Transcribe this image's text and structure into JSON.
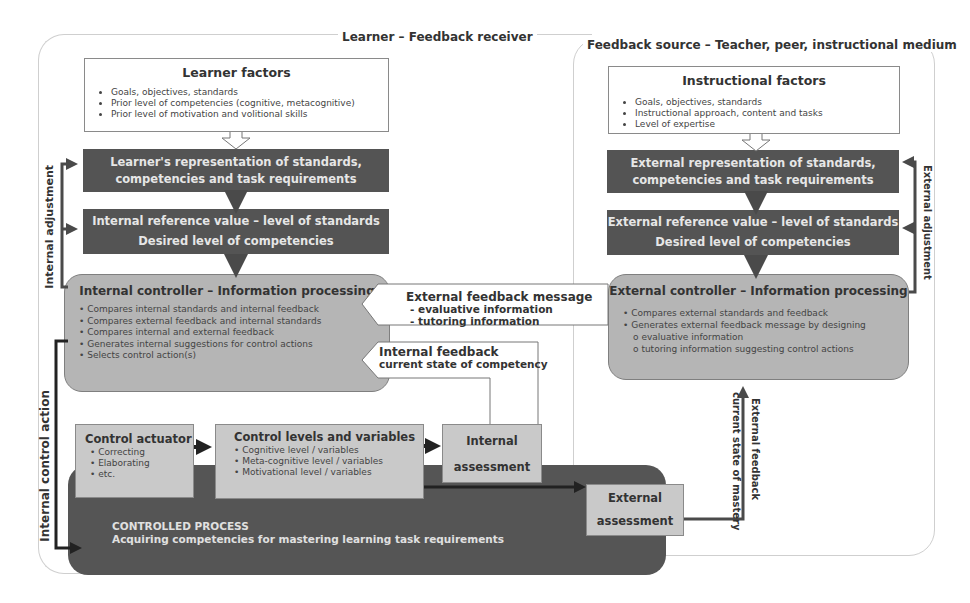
{
  "learner_region": {
    "title": "Learner – Feedback receiver",
    "factors": {
      "title": "Learner factors",
      "items": [
        "Goals, objectives, standards",
        "Prior level of competencies (cognitive, metacognitive)",
        "Prior level of motivation and volitional skills"
      ]
    },
    "representation": {
      "line1": "Learner's representation of  standards,",
      "line2": "competencies and task requirements"
    },
    "reference": {
      "line1": "Internal reference value – level of standards",
      "line2": "Desired level of competencies"
    },
    "controller": {
      "title": "Internal controller – Information processing",
      "items": [
        "Compares internal standards and internal feedback",
        "Compares external feedback and internal standards",
        "Compares internal and external feedback",
        "Generates internal suggestions for control actions",
        "Selects control action(s)"
      ]
    },
    "adjustment_label": "Internal adjustment",
    "control_action_label": "Internal control action",
    "actuator": {
      "title": "Control actuator",
      "items": [
        "Correcting",
        "Elaborating",
        "etc."
      ]
    },
    "levels": {
      "title": "Control levels and variables",
      "items": [
        "Cognitive level / variables",
        "Meta-cognitive level / variables",
        "Motivational level / variables"
      ]
    },
    "internal_assessment": {
      "line1": "Internal",
      "line2": "assessment"
    },
    "process": {
      "line1": "CONTROLLED PROCESS",
      "line2": "Acquiring competencies for mastering learning task requirements"
    },
    "internal_feedback": {
      "title": "Internal feedback",
      "subtitle": "current state of competency"
    }
  },
  "source_region": {
    "title": "Feedback source – Teacher, peer, instructional medium",
    "factors": {
      "title": "Instructional factors",
      "items": [
        "Goals, objectives, standards",
        "Instructional approach, content and tasks",
        "Level of expertise"
      ]
    },
    "representation": {
      "line1": "External representation of standards,",
      "line2": "competencies and task requirements"
    },
    "reference": {
      "line1": "External reference value – level of standards",
      "line2": "Desired level of competencies"
    },
    "controller": {
      "title": "External controller – Information processing",
      "items": [
        "Compares external standards and feedback",
        "Generates external feedback message by designing"
      ],
      "subitems": [
        "evaluative information",
        "tutoring information suggesting control actions"
      ]
    },
    "adjustment_label": "External adjustment",
    "external_assessment": {
      "line1": "External",
      "line2": "assessment"
    },
    "external_feedback": {
      "line1": "External feedback",
      "line2": "current state of mastery"
    }
  },
  "external_message": {
    "title": "External feedback message",
    "items": [
      "-  evaluative information",
      "-  tutoring information"
    ]
  },
  "colors": {
    "dark_box": "#545454",
    "controller": "#b5b5b5",
    "light_box": "#c9c9c9",
    "process": "#555555",
    "arrow": "#4a4a4a"
  }
}
